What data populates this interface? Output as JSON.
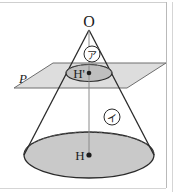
{
  "figure": {
    "colors": {
      "stroke": "#1c1c1c",
      "base_fill": "#c9c9c9",
      "plane_fill": "#d8d8d8",
      "small_ellipse_fill": "#bdbdbd",
      "axis_line": "#8a8a8a",
      "frame_border": "#c0c0c0",
      "background": "#ffffff"
    },
    "labels": {
      "apex": "O",
      "plane": "P",
      "small_center": "H'",
      "base_center": "H",
      "region_upper": "ア",
      "region_lower": "イ"
    },
    "points": {
      "apex": {
        "x": 89,
        "y": 30
      },
      "small_center": {
        "x": 89,
        "y": 73
      },
      "base_center": {
        "x": 89,
        "y": 155
      }
    },
    "annotations": [
      {
        "name": "region-upper-callout",
        "text": "ア",
        "cx": 92,
        "cy": 54,
        "r": 8
      },
      {
        "name": "region-lower-callout",
        "text": "イ",
        "cx": 112,
        "cy": 117,
        "r": 8
      }
    ]
  }
}
